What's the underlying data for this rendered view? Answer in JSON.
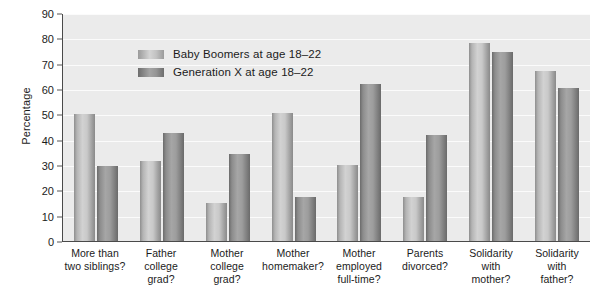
{
  "chart_data": {
    "type": "bar",
    "title": "",
    "xlabel": "",
    "ylabel": "Percentage",
    "ylim": [
      0,
      90
    ],
    "yticks": [
      0,
      10,
      20,
      30,
      40,
      50,
      60,
      70,
      80,
      90
    ],
    "grid": true,
    "legend_position": "inside-top-left",
    "categories": [
      "More than two siblings?",
      "Father college grad?",
      "Mother college grad?",
      "Mother homemaker?",
      "Mother employed full-time?",
      "Parents divorced?",
      "Solidarity with mother?",
      "Solidarity with father?"
    ],
    "category_lines": [
      [
        "More than",
        "two siblings?"
      ],
      [
        "Father",
        "college",
        "grad?"
      ],
      [
        "Mother",
        "college",
        "grad?"
      ],
      [
        "Mother",
        "homemaker?"
      ],
      [
        "Mother",
        "employed",
        "full-time?"
      ],
      [
        "Parents",
        "divorced?"
      ],
      [
        "Solidarity",
        "with",
        "mother?"
      ],
      [
        "Solidarity",
        "with",
        "father?"
      ]
    ],
    "series": [
      {
        "name": "Baby Boomers at age 18–22",
        "color": "#c9c9c9",
        "values": [
          50,
          31.5,
          15,
          50.5,
          30,
          17.5,
          78,
          67
        ]
      },
      {
        "name": "Generation X at age 18–22",
        "color": "#8f8f8f",
        "values": [
          29.5,
          42.5,
          34.5,
          17.5,
          62,
          42,
          74.5,
          60.5
        ]
      }
    ]
  },
  "legend": {
    "items": [
      {
        "label": "Baby Boomers at age 18–22",
        "swatch": "boomer"
      },
      {
        "label": "Generation X at age 18–22",
        "swatch": "genx"
      }
    ]
  },
  "axes": {
    "y_title": "Percentage",
    "y_tick_labels": [
      "90",
      "80",
      "70",
      "60",
      "50",
      "40",
      "30",
      "20",
      "10",
      "0"
    ]
  },
  "colors": {
    "plot_background": "#ebebeb",
    "gridline": "#fbfbfb",
    "axis_line": "#4a4a4a",
    "text": "#1b1b1b",
    "bar_boomer": "#c9c9c9",
    "bar_genx": "#8f8f8f"
  }
}
